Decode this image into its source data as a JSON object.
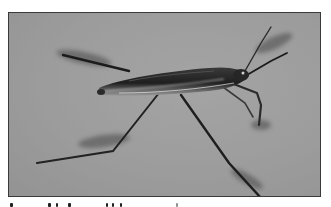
{
  "photo": {
    "subject": "water strider insect standing on water surface",
    "color_mode": "grayscale",
    "colors": {
      "water": "#9e9e9e",
      "water_dark_edge": "#8c8c8c",
      "frame_border": "#3a3a3a",
      "insect_body": "#2b2b2b",
      "insect_highlight": "#d8d8d8",
      "shadow": "#5a5a5a"
    }
  },
  "caption": {
    "visible": "partially cropped, unreadable"
  }
}
